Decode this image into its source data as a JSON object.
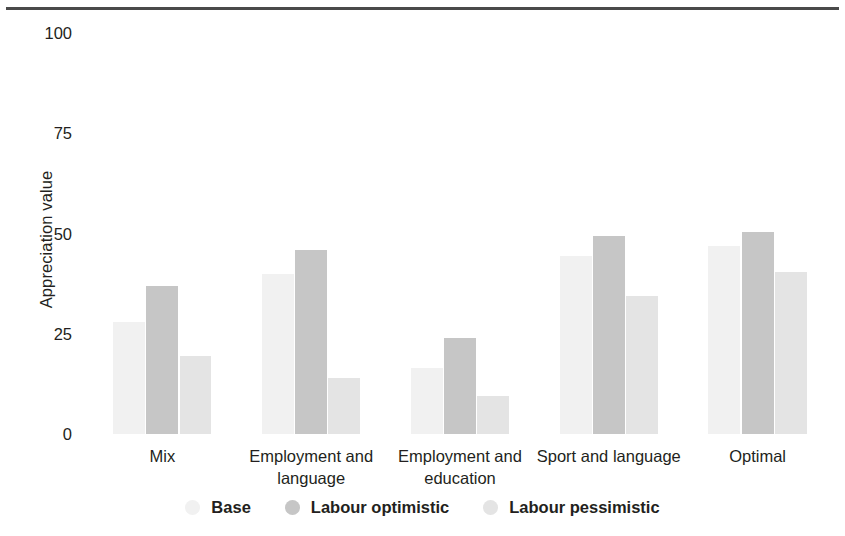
{
  "chart_data": {
    "type": "bar",
    "title": "",
    "subtitle": "",
    "xlabel": "",
    "ylabel": "Appreciation value",
    "ylim": [
      0,
      100
    ],
    "yticks": [
      0,
      25,
      50,
      75,
      100
    ],
    "ytick_labels": [
      "0",
      "25",
      "50",
      "75",
      "100"
    ],
    "grid": false,
    "legend_position": "bottom",
    "categories": [
      "Mix",
      "Employment and language",
      "Employment and education",
      "Sport and language",
      "Optimal"
    ],
    "series": [
      {
        "name": "Base",
        "color": "#f1f1f1",
        "values": [
          28,
          40,
          16.5,
          44.5,
          47
        ]
      },
      {
        "name": "Labour optimistic",
        "color": "#c6c6c6",
        "values": [
          37,
          46,
          24,
          49.5,
          50.5
        ]
      },
      {
        "name": "Labour pessimistic",
        "color": "#e4e4e4",
        "values": [
          19.5,
          14,
          9.5,
          34.5,
          40.5
        ]
      }
    ]
  },
  "decoration": {
    "top_rule_color": "#4a4a4a"
  }
}
